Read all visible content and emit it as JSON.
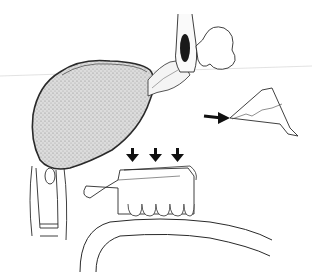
{
  "figure": {
    "width": 312,
    "height": 272,
    "background": "#ffffff",
    "line_color": "#2a2a2a",
    "stipple_fill": "#d4d4d4",
    "dark_fill": "#1a1a1a",
    "elements": [
      {
        "name": "stippled-organ",
        "description": "large stippled lobed mass"
      },
      {
        "name": "nasal-structure",
        "description": "vertical bone with dark cavity and curled soft tissue"
      },
      {
        "name": "bone-fragment",
        "description": "triangular fragment with jagged line"
      },
      {
        "name": "pointer-arrow",
        "direction": "right",
        "target": "bone-fragment"
      },
      {
        "name": "down-arrows",
        "count": 3,
        "direction": "down",
        "target": "maxilla"
      },
      {
        "name": "maxilla-with-teeth",
        "description": "upper jaw with palate and row of teeth"
      },
      {
        "name": "vertebrae",
        "description": "cervical spine segment"
      },
      {
        "name": "lower-contour",
        "description": "curved outline of tongue/floor"
      }
    ]
  }
}
